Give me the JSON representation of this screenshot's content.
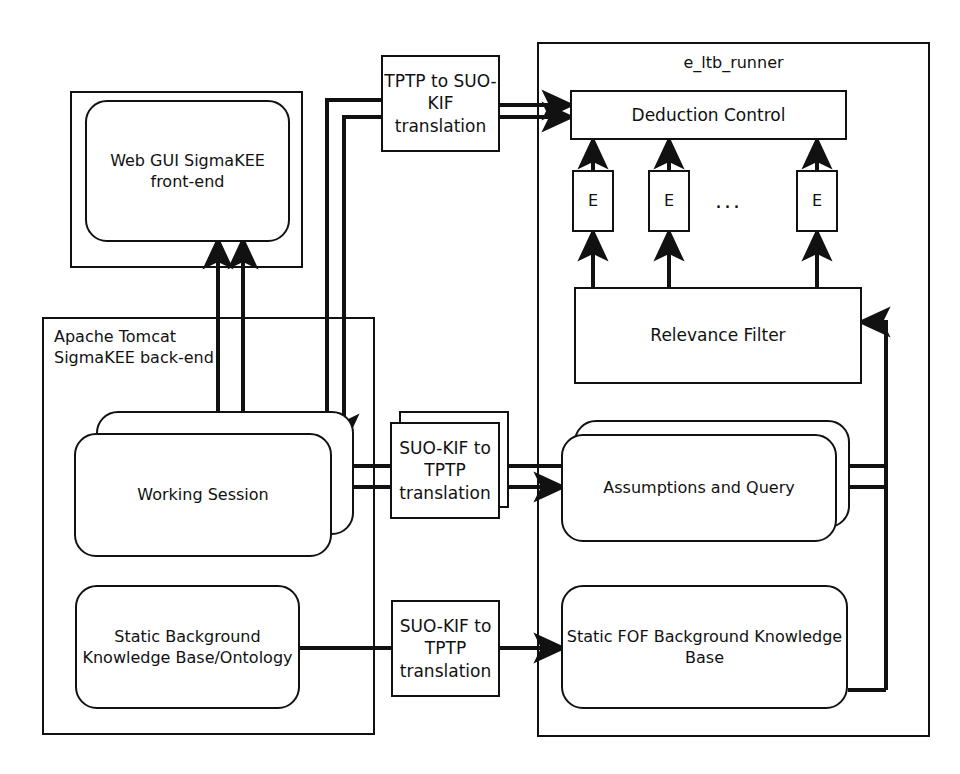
{
  "diagram": {
    "stroke_color": "#111111",
    "background_color": "#ffffff"
  },
  "frames": {
    "web_gui_frame": {
      "name": "web-gui-container"
    },
    "tomcat_frame": {
      "label": "Apache Tomcat\nSigmaKEE back-end"
    },
    "runner_frame": {
      "label": "e_ltb_runner"
    }
  },
  "nodes": {
    "web_gui": {
      "label": "Web GUI\nSigmaKEE front-end"
    },
    "tptp_to_suokif": {
      "label": "TPTP to\nSUO-KIF\ntranslation"
    },
    "deduction_control": {
      "label": "Deduction Control"
    },
    "prover_1": {
      "label": "E"
    },
    "prover_2": {
      "label": "E"
    },
    "prover_ellipsis": {
      "label": "..."
    },
    "prover_n": {
      "label": "E"
    },
    "relevance_filter": {
      "label": "Relevance Filter"
    },
    "working_session": {
      "label": "Working Session"
    },
    "suokif_to_tptp_session": {
      "label": "SUO-KIF\nto TPTP\ntranslation"
    },
    "assumptions_and_query": {
      "label": "Assumptions and Query"
    },
    "static_background_kb": {
      "label": "Static Background\nKnowledge Base/Ontology"
    },
    "suokif_to_tptp_kb": {
      "label": "SUO-KIF\nto TPTP\ntranslation"
    },
    "static_fof_kb": {
      "label": "Static FOF Background\nKnowledge Base"
    }
  }
}
